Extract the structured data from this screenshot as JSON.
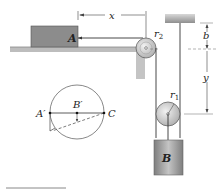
{
  "figure": {
    "labels": {
      "block_a": "A",
      "block_b": "B",
      "x": "x",
      "y": "y",
      "b": "b",
      "r1": "r",
      "r1_sub": "1",
      "r2": "r",
      "r2_sub": "2",
      "a_prime": "A′",
      "b_prime": "B′",
      "c": "C"
    },
    "colors": {
      "block_fill": "#8a8a8a",
      "block_b_fill": "#9a9a9a",
      "ground": "#b5b5b5",
      "line": "#333333",
      "pulley": "#c8c8c8"
    }
  }
}
